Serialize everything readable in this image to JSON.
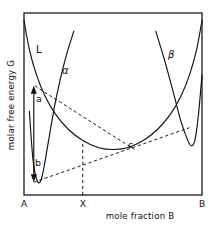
{
  "figure": {
    "background_color": "#ffffff",
    "line_color": "#111111"
  },
  "axes": {
    "y_title": "molar free energy  G",
    "x_title": "mole fraction B",
    "x_ticks": [
      {
        "label": "A",
        "position": 0.0
      },
      {
        "label": "X",
        "position": 0.33
      },
      {
        "label": "B",
        "position": 1.0
      }
    ],
    "frame": {
      "left": 24,
      "top": 13,
      "right": 202,
      "bottom": 195
    },
    "grid": false
  },
  "curve_labels": [
    {
      "name": "liquid",
      "label": "L"
    },
    {
      "name": "alpha-phase",
      "label": "α"
    },
    {
      "name": "beta-phase",
      "label": "β"
    }
  ],
  "point_labels": [
    {
      "name": "point-a",
      "label": "a"
    },
    {
      "name": "point-b",
      "label": "b"
    },
    {
      "name": "point-c",
      "label": "c"
    }
  ],
  "chart_data": {
    "type": "line",
    "title": "",
    "xlabel": "mole fraction B",
    "ylabel": "molar free energy  G",
    "xlim": [
      0,
      1
    ],
    "ylim": [
      0,
      1
    ],
    "grid": false,
    "legend": "inline-curve-labels",
    "series": [
      {
        "name": "L",
        "label": "L",
        "description": "liquid free energy curve, broad upward-opening curve spanning full composition range",
        "x": [
          0.0,
          0.03,
          0.07,
          0.12,
          0.18,
          0.25,
          0.33,
          0.42,
          0.5,
          0.58,
          0.67,
          0.75,
          0.82,
          0.88,
          0.93,
          0.97,
          1.0
        ],
        "y": [
          0.96,
          0.8,
          0.66,
          0.54,
          0.44,
          0.36,
          0.3,
          0.26,
          0.25,
          0.26,
          0.3,
          0.36,
          0.44,
          0.54,
          0.66,
          0.8,
          0.96
        ]
      },
      {
        "name": "alpha",
        "label": "α",
        "description": "alpha solid solution free energy curve, narrow steep well near pure A",
        "x": [
          0.03,
          0.05,
          0.07,
          0.09,
          0.11,
          0.14,
          0.18,
          0.23,
          0.28
        ],
        "y": [
          0.46,
          0.2,
          0.09,
          0.07,
          0.14,
          0.31,
          0.53,
          0.74,
          0.9
        ]
      },
      {
        "name": "beta",
        "label": "β",
        "description": "beta solid solution free energy curve, narrow steep well near pure B",
        "x": [
          0.74,
          0.79,
          0.84,
          0.88,
          0.92,
          0.94,
          0.96,
          0.98,
          1.0
        ],
        "y": [
          0.9,
          0.74,
          0.56,
          0.41,
          0.3,
          0.27,
          0.3,
          0.44,
          0.66
        ]
      }
    ],
    "annotations": [
      {
        "name": "upper-tangent",
        "type": "dashed-line",
        "label": "tangent from a to L curve",
        "x": [
          0.06,
          0.62
        ],
        "y": [
          0.6,
          0.25
        ]
      },
      {
        "name": "common-tangent",
        "type": "dashed-line",
        "label": "common tangent b to c",
        "x": [
          0.055,
          0.93
        ],
        "y": [
          0.07,
          0.37
        ]
      },
      {
        "name": "composition-line-X",
        "type": "dashed-vertical",
        "label": "X",
        "x": 0.33,
        "y_from": 0.0,
        "y_to": 0.3
      },
      {
        "name": "free-energy-arrow",
        "type": "double-arrow",
        "label": "a to b free energy difference",
        "x": 0.055,
        "y_from": 0.07,
        "y_to": 0.6
      }
    ]
  }
}
